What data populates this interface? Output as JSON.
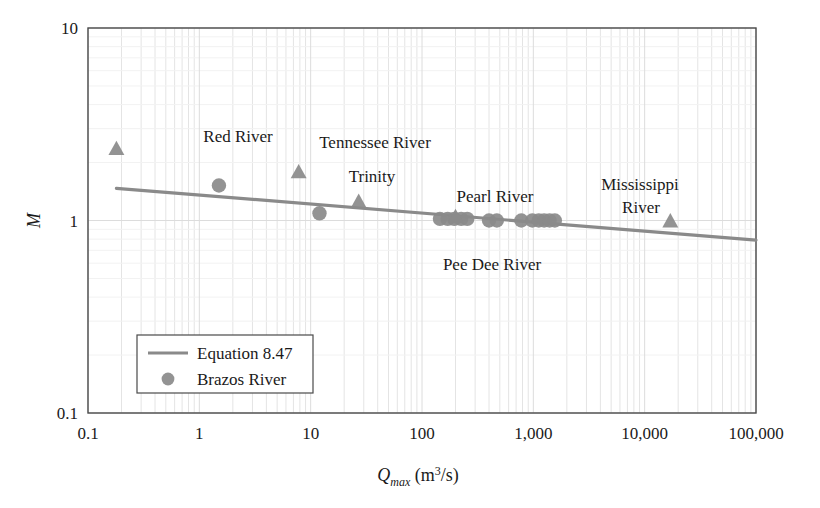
{
  "chart_data": {
    "type": "scatter",
    "title": "",
    "xlabel": "Q_max (m^3/s)",
    "xlabel_base": "Q",
    "xlabel_sub": "max",
    "xlabel_unit_open": " (m",
    "xlabel_unit_sup": "3",
    "xlabel_unit_close": "/s)",
    "ylabel": "M",
    "xscale": "log",
    "yscale": "log",
    "xlim": [
      0.1,
      100000
    ],
    "ylim": [
      0.1,
      10
    ],
    "grid": true,
    "grid_minor": true,
    "xticks": [
      0.1,
      1,
      10,
      100,
      1000,
      10000,
      100000
    ],
    "xticklabels": [
      "0.1",
      "1",
      "10",
      "100",
      "1,000",
      "10,000",
      "100,000"
    ],
    "yticks": [
      0.1,
      1,
      10
    ],
    "yticklabels": [
      "0.1",
      "1",
      "10"
    ],
    "marker_color": "#8a8a8a",
    "line_color": "#8a8a8a",
    "axis_color": "#4a4a4a",
    "grid_color": "#e4e4e4",
    "text_color": "#1a1a1a",
    "series": [
      {
        "name": "Equation 8.47",
        "type": "line",
        "marker": "line",
        "points": [
          {
            "x": 0.18,
            "y": 1.47
          },
          {
            "x": 100000,
            "y": 0.79
          }
        ]
      },
      {
        "name": "Brazos River",
        "type": "scatter",
        "marker": "circle",
        "points": [
          {
            "x": 1.5,
            "y": 1.52
          },
          {
            "x": 12.0,
            "y": 1.09
          },
          {
            "x": 145,
            "y": 1.02
          },
          {
            "x": 170,
            "y": 1.02
          },
          {
            "x": 195,
            "y": 1.02
          },
          {
            "x": 225,
            "y": 1.02
          },
          {
            "x": 255,
            "y": 1.02
          },
          {
            "x": 400,
            "y": 1.0
          },
          {
            "x": 470,
            "y": 1.0
          },
          {
            "x": 780,
            "y": 1.0
          },
          {
            "x": 980,
            "y": 1.0
          },
          {
            "x": 1120,
            "y": 1.0
          },
          {
            "x": 1250,
            "y": 1.0
          },
          {
            "x": 1400,
            "y": 1.0
          },
          {
            "x": 1560,
            "y": 1.0
          }
        ]
      },
      {
        "name": "Named rivers",
        "type": "scatter",
        "marker": "triangle",
        "points": [
          {
            "x": 0.18,
            "y": 2.35,
            "label": "Red River"
          },
          {
            "x": 7.8,
            "y": 1.78,
            "label": "Tennessee River"
          },
          {
            "x": 27,
            "y": 1.25,
            "label": "Trinity"
          },
          {
            "x": 200,
            "y": 1.04,
            "label": "Pearl River"
          },
          {
            "x": 17000,
            "y": 0.99,
            "label": "Mississippi River"
          }
        ]
      }
    ],
    "annotations": [
      {
        "text": "Red River",
        "x_px": 238,
        "y_px": 142,
        "anchor": "middle"
      },
      {
        "text": "Tennessee River",
        "x_px": 375,
        "y_px": 148,
        "anchor": "middle"
      },
      {
        "text": "Trinity",
        "x_px": 372,
        "y_px": 182,
        "anchor": "middle"
      },
      {
        "text": "Pearl River",
        "x_px": 495,
        "y_px": 202,
        "anchor": "middle"
      },
      {
        "text": "Mississippi",
        "x_px": 640,
        "y_px": 190,
        "anchor": "middle"
      },
      {
        "text": "River",
        "x_px": 641,
        "y_px": 213,
        "anchor": "middle"
      },
      {
        "text": "Pee Dee River",
        "x_px": 492,
        "y_px": 270,
        "anchor": "middle"
      }
    ],
    "legend": {
      "position": "lower-left-inside",
      "entries": [
        {
          "label": "Equation 8.47",
          "marker": "line"
        },
        {
          "label": "Brazos River",
          "marker": "circle"
        }
      ]
    }
  }
}
